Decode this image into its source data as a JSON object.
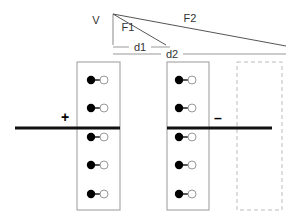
{
  "figure": {
    "background": "#ffffff"
  },
  "vectors": {
    "apex": {
      "x": 113,
      "y": 14
    },
    "v_label": "V",
    "v_label_pos": {
      "x": 96,
      "y": 24
    },
    "f1_label": "F1",
    "f1_label_pos": {
      "x": 128,
      "y": 31
    },
    "f1_end": {
      "x": 166,
      "y": 45
    },
    "f2_label": "F2",
    "f2_label_pos": {
      "x": 190,
      "y": 22
    },
    "f2_end": {
      "x": 286,
      "y": 46
    },
    "vertical_drop": {
      "x": 113,
      "y_top": 14,
      "y_bottom": 45
    }
  },
  "dimensions": [
    {
      "label": "d1",
      "label_x": 140,
      "label_y": 51,
      "x1": 113,
      "x2": 170,
      "y": 47
    },
    {
      "label": "d2",
      "label_x": 172,
      "label_y": 58,
      "x1": 113,
      "x2": 286,
      "y": 54
    }
  ],
  "plates": [
    {
      "name": "positive-plate",
      "sign": "+",
      "sign_x": 65,
      "sign_y": 122,
      "x1": 15,
      "x2": 120,
      "y": 128,
      "color": "#111111"
    },
    {
      "name": "negative-plate",
      "sign": "–",
      "sign_x": 218,
      "sign_y": 123,
      "x1": 167,
      "x2": 272,
      "y": 128,
      "color": "#111111"
    }
  ],
  "boxes": [
    {
      "name": "dielectric-slab-1",
      "style": "solid",
      "x": 77,
      "y": 62,
      "width": 43,
      "height": 148,
      "stroke": "#999999",
      "dipoles": [
        {
          "cx": 91,
          "cy": 80
        },
        {
          "cx": 91,
          "cy": 108
        },
        {
          "cx": 91,
          "cy": 137
        },
        {
          "cx": 91,
          "cy": 165
        },
        {
          "cx": 91,
          "cy": 194
        }
      ]
    },
    {
      "name": "dielectric-slab-2",
      "style": "solid",
      "x": 167,
      "y": 62,
      "width": 42,
      "height": 148,
      "stroke": "#999999",
      "dipoles": [
        {
          "cx": 179,
          "cy": 80
        },
        {
          "cx": 179,
          "cy": 108
        },
        {
          "cx": 179,
          "cy": 137
        },
        {
          "cx": 179,
          "cy": 165
        },
        {
          "cx": 179,
          "cy": 194
        }
      ]
    },
    {
      "name": "empty-region-dashed",
      "style": "dashed",
      "x": 237,
      "y": 62,
      "width": 45,
      "height": 148,
      "stroke": "#bbbbbb",
      "dipoles": []
    }
  ],
  "dipole_style": {
    "negative_radius": 4.2,
    "positive_radius": 4.0,
    "bond_length": 13,
    "negative_fill": "#000000",
    "positive_fill": "#ffffff",
    "positive_stroke": "#999999"
  }
}
